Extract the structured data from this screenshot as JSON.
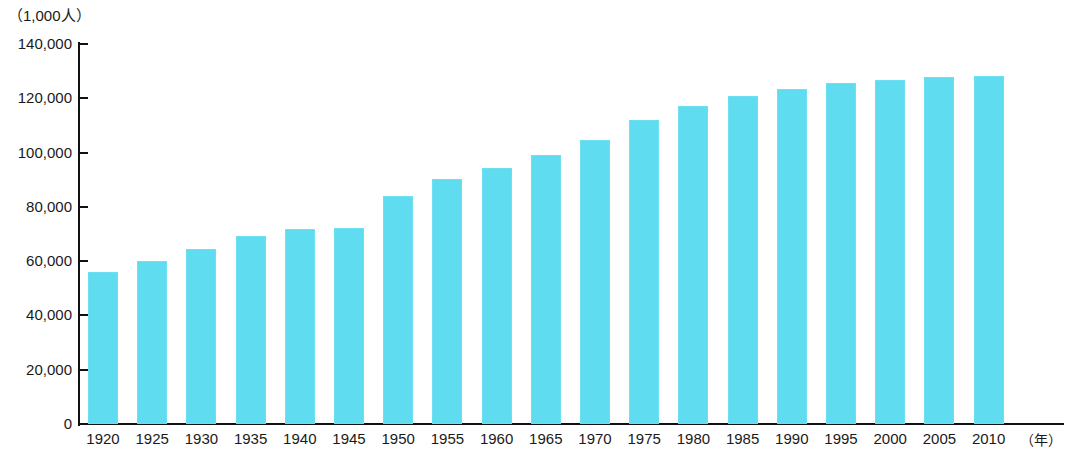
{
  "chart_data": {
    "type": "bar",
    "title": "",
    "subtitle": "",
    "unit_label": "（1,000人）",
    "xlabel": "（年）",
    "ylabel": "",
    "categories": [
      "1920",
      "1925",
      "1930",
      "1935",
      "1940",
      "1945",
      "1950",
      "1955",
      "1960",
      "1965",
      "1970",
      "1975",
      "1980",
      "1985",
      "1990",
      "1995",
      "2000",
      "2005",
      "2010"
    ],
    "values": [
      56000,
      60000,
      64500,
      69300,
      71900,
      72100,
      84000,
      90100,
      94300,
      99200,
      104700,
      111900,
      117100,
      121000,
      123600,
      125600,
      126900,
      127800,
      128100
    ],
    "ylim": [
      0,
      140000
    ],
    "ytick_values": [
      0,
      20000,
      40000,
      60000,
      80000,
      100000,
      120000,
      140000
    ],
    "ytick_labels": [
      "0",
      "20,000",
      "40,000",
      "60,000",
      "80,000",
      "100,000",
      "120,000",
      "140,000"
    ],
    "grid": false,
    "legend": null,
    "legend_position": "none",
    "series": [
      {
        "name": "人口",
        "values": [
          56000,
          60000,
          64500,
          69300,
          71900,
          72100,
          84000,
          90100,
          94300,
          99200,
          104700,
          111900,
          117100,
          121000,
          123600,
          125600,
          126900,
          127800,
          128100
        ]
      }
    ],
    "bar_color": "#5FDCF0",
    "axis_color": "#111111"
  }
}
